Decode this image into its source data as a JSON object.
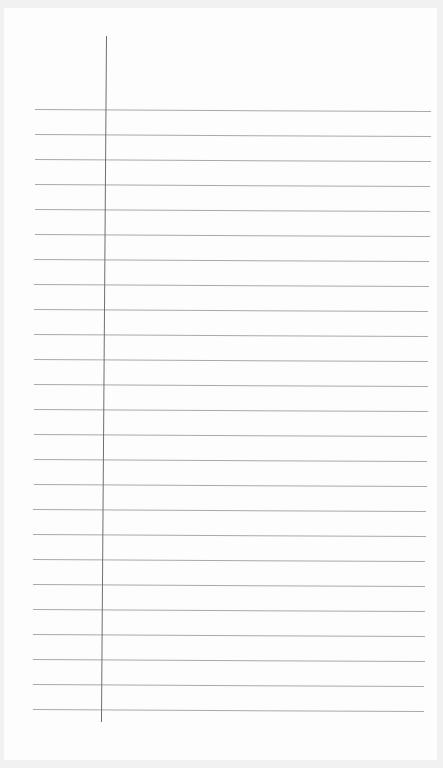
{
  "page": {
    "kind": "blank lined notebook paper",
    "ruled_line_count": 25,
    "has_margin_line": true,
    "text": ""
  },
  "colors": {
    "background": "#f1f1f1",
    "paper": "#fdfdfd",
    "rule": "#a9a9a9",
    "margin": "#6f6f6f"
  }
}
